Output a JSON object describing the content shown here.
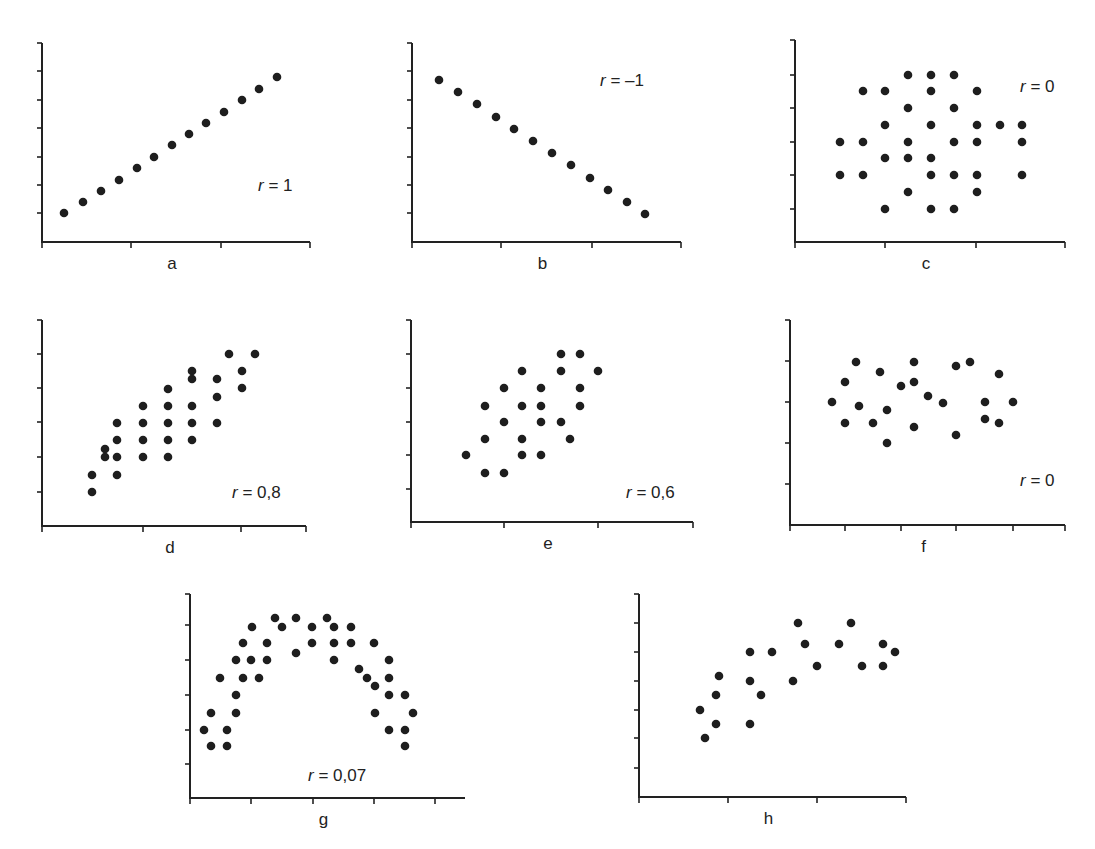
{
  "chart_data": [
    {
      "id": "a",
      "type": "scatter",
      "label": "a",
      "annotation": "r = 1",
      "r_value": "1",
      "frame": {
        "x0": 42,
        "y0": 242,
        "ytop": 43,
        "xend": 310,
        "yticks": [
          213,
          185,
          157,
          128,
          100,
          71,
          43
        ],
        "xticks": [
          131,
          221,
          310
        ]
      },
      "annotation_pos": [
        258,
        191
      ],
      "points": [
        [
          64,
          213
        ],
        [
          83,
          202
        ],
        [
          101,
          191
        ],
        [
          119,
          180
        ],
        [
          137,
          168
        ],
        [
          154,
          157
        ],
        [
          172,
          145
        ],
        [
          189,
          134
        ],
        [
          206,
          123
        ],
        [
          224,
          112
        ],
        [
          242,
          100
        ],
        [
          259,
          89
        ],
        [
          277,
          77
        ]
      ]
    },
    {
      "id": "b",
      "type": "scatter",
      "label": "b",
      "annotation": "r = –1",
      "r_value": "–1",
      "frame": {
        "x0": 412,
        "y0": 242,
        "ytop": 43,
        "xend": 681,
        "yticks": [
          213,
          185,
          157,
          128,
          100,
          71,
          43
        ],
        "xticks": [
          501,
          592,
          681
        ]
      },
      "annotation_pos": [
        600,
        86
      ],
      "points": [
        [
          439,
          80
        ],
        [
          458,
          92
        ],
        [
          477,
          104
        ],
        [
          496,
          117
        ],
        [
          514,
          129
        ],
        [
          533,
          141
        ],
        [
          552,
          153
        ],
        [
          571,
          165
        ],
        [
          590,
          178
        ],
        [
          608,
          190
        ],
        [
          627,
          202
        ],
        [
          645,
          214
        ]
      ]
    },
    {
      "id": "c",
      "type": "scatter",
      "label": "c",
      "annotation": "r = 0",
      "r_value": "0",
      "frame": {
        "x0": 795,
        "y0": 242,
        "ytop": 40,
        "xend": 1065,
        "yticks": [
          209,
          175,
          142,
          108,
          75,
          40
        ],
        "xticks": [
          885,
          976,
          1065
        ]
      },
      "annotation_pos": [
        1020,
        92
      ],
      "points": [
        [
          908,
          75
        ],
        [
          931,
          75
        ],
        [
          954,
          75
        ],
        [
          863,
          91
        ],
        [
          885,
          91
        ],
        [
          931,
          91
        ],
        [
          977,
          91
        ],
        [
          908,
          108
        ],
        [
          954,
          108
        ],
        [
          885,
          125
        ],
        [
          931,
          125
        ],
        [
          977,
          125
        ],
        [
          1000,
          125
        ],
        [
          1022,
          125
        ],
        [
          840,
          142
        ],
        [
          863,
          142
        ],
        [
          908,
          142
        ],
        [
          954,
          142
        ],
        [
          977,
          142
        ],
        [
          1022,
          142
        ],
        [
          885,
          158
        ],
        [
          908,
          158
        ],
        [
          931,
          158
        ],
        [
          840,
          175
        ],
        [
          863,
          175
        ],
        [
          931,
          175
        ],
        [
          954,
          175
        ],
        [
          977,
          175
        ],
        [
          1022,
          175
        ],
        [
          908,
          192
        ],
        [
          977,
          192
        ],
        [
          885,
          209
        ],
        [
          931,
          209
        ],
        [
          954,
          209
        ]
      ]
    },
    {
      "id": "d",
      "type": "scatter",
      "label": "d",
      "annotation": "r = 0,8",
      "r_value": "0,8",
      "frame": {
        "x0": 42,
        "y0": 526,
        "ytop": 320,
        "xend": 306,
        "yticks": [
          492,
          457,
          422,
          388,
          354,
          320
        ],
        "xticks": [
          143,
          241,
          306
        ]
      },
      "annotation_pos": [
        232,
        498
      ],
      "points": [
        [
          92,
          492
        ],
        [
          92,
          475
        ],
        [
          105,
          449
        ],
        [
          105,
          457
        ],
        [
          117,
          423
        ],
        [
          117,
          440
        ],
        [
          117,
          457
        ],
        [
          117,
          475
        ],
        [
          143,
          406
        ],
        [
          143,
          423
        ],
        [
          143,
          440
        ],
        [
          143,
          457
        ],
        [
          168,
          389
        ],
        [
          168,
          406
        ],
        [
          168,
          423
        ],
        [
          168,
          440
        ],
        [
          168,
          457
        ],
        [
          192,
          371
        ],
        [
          192,
          379
        ],
        [
          192,
          406
        ],
        [
          192,
          423
        ],
        [
          192,
          440
        ],
        [
          217,
          379
        ],
        [
          217,
          397
        ],
        [
          217,
          423
        ],
        [
          229,
          354
        ],
        [
          242,
          371
        ],
        [
          242,
          388
        ],
        [
          255,
          354
        ]
      ]
    },
    {
      "id": "e",
      "type": "scatter",
      "label": "e",
      "annotation": "r = 0,6",
      "r_value": "0,6",
      "frame": {
        "x0": 411,
        "y0": 522,
        "ytop": 320,
        "xend": 693,
        "yticks": [
          489,
          455,
          422,
          388,
          354,
          320
        ],
        "xticks": [
          504,
          598,
          693
        ]
      },
      "annotation_pos": [
        626,
        498
      ],
      "points": [
        [
          466,
          455
        ],
        [
          485,
          406
        ],
        [
          485,
          439
        ],
        [
          485,
          473
        ],
        [
          504,
          388
        ],
        [
          504,
          422
        ],
        [
          504,
          473
        ],
        [
          522,
          371
        ],
        [
          522,
          406
        ],
        [
          522,
          439
        ],
        [
          522,
          455
        ],
        [
          541,
          388
        ],
        [
          541,
          406
        ],
        [
          541,
          422
        ],
        [
          541,
          455
        ],
        [
          561,
          354
        ],
        [
          561,
          371
        ],
        [
          561,
          422
        ],
        [
          570,
          439
        ],
        [
          580,
          354
        ],
        [
          580,
          388
        ],
        [
          580,
          406
        ],
        [
          598,
          371
        ]
      ]
    },
    {
      "id": "f",
      "type": "scatter",
      "label": "f",
      "annotation": "r = 0",
      "r_value": "0",
      "frame": {
        "x0": 790,
        "y0": 525,
        "ytop": 320,
        "xend": 1065,
        "yticks": [
          484,
          443,
          402,
          361,
          320
        ],
        "xticks": [
          845,
          901,
          956,
          1013,
          1065
        ]
      },
      "annotation_pos": [
        1020,
        486
      ],
      "points": [
        [
          832,
          402
        ],
        [
          845,
          382
        ],
        [
          845,
          423
        ],
        [
          856,
          362
        ],
        [
          859,
          406
        ],
        [
          873,
          423
        ],
        [
          880,
          372
        ],
        [
          887,
          410
        ],
        [
          887,
          443
        ],
        [
          901,
          386
        ],
        [
          914,
          427
        ],
        [
          914,
          382
        ],
        [
          914,
          362
        ],
        [
          928,
          396
        ],
        [
          943,
          403
        ],
        [
          956,
          366
        ],
        [
          956,
          435
        ],
        [
          970,
          362
        ],
        [
          985,
          402
        ],
        [
          985,
          419
        ],
        [
          999,
          374
        ],
        [
          999,
          423
        ],
        [
          1013,
          402
        ]
      ]
    },
    {
      "id": "g",
      "type": "scatter",
      "label": "g",
      "annotation": "r = 0,07",
      "r_value": "0,07",
      "frame": {
        "x0": 190,
        "y0": 798,
        "ytop": 594,
        "xend": 465,
        "yticks": [
          764,
          730,
          695,
          660,
          625,
          594
        ],
        "xticks": [
          251,
          313,
          374,
          435
        ]
      },
      "annotation_pos": [
        308,
        781
      ],
      "points": [
        [
          204,
          730
        ],
        [
          211,
          713
        ],
        [
          211,
          746
        ],
        [
          220,
          678
        ],
        [
          227,
          730
        ],
        [
          227,
          746
        ],
        [
          236,
          695
        ],
        [
          236,
          713
        ],
        [
          236,
          660
        ],
        [
          243,
          678
        ],
        [
          243,
          643
        ],
        [
          251,
          660
        ],
        [
          252,
          627
        ],
        [
          259,
          678
        ],
        [
          267,
          643
        ],
        [
          267,
          660
        ],
        [
          275,
          618
        ],
        [
          282,
          627
        ],
        [
          296,
          618
        ],
        [
          296,
          653
        ],
        [
          312,
          627
        ],
        [
          312,
          643
        ],
        [
          327,
          618
        ],
        [
          334,
          627
        ],
        [
          334,
          643
        ],
        [
          334,
          660
        ],
        [
          351,
          627
        ],
        [
          351,
          643
        ],
        [
          359,
          669
        ],
        [
          367,
          678
        ],
        [
          374,
          643
        ],
        [
          375,
          686
        ],
        [
          375,
          713
        ],
        [
          389,
          660
        ],
        [
          389,
          678
        ],
        [
          389,
          695
        ],
        [
          389,
          730
        ],
        [
          405,
          695
        ],
        [
          405,
          730
        ],
        [
          405,
          746
        ],
        [
          413,
          713
        ]
      ]
    },
    {
      "id": "h",
      "type": "scatter",
      "label": "h",
      "annotation": "",
      "r_value": "",
      "frame": {
        "x0": 639,
        "y0": 797,
        "ytop": 594,
        "xend": 906,
        "yticks": [
          768,
          738,
          710,
          681,
          652,
          623,
          594
        ],
        "xticks": [
          728,
          817,
          906
        ]
      },
      "annotation_pos": [
        0,
        0
      ],
      "points": [
        [
          700,
          710
        ],
        [
          705,
          738
        ],
        [
          716,
          724
        ],
        [
          716,
          695
        ],
        [
          719,
          676
        ],
        [
          750,
          652
        ],
        [
          750,
          681
        ],
        [
          750,
          724
        ],
        [
          761,
          695
        ],
        [
          772,
          652
        ],
        [
          793,
          681
        ],
        [
          798,
          623
        ],
        [
          805,
          644
        ],
        [
          817,
          666
        ],
        [
          839,
          644
        ],
        [
          851,
          623
        ],
        [
          862,
          666
        ],
        [
          883,
          644
        ],
        [
          883,
          666
        ],
        [
          895,
          652
        ]
      ]
    }
  ]
}
